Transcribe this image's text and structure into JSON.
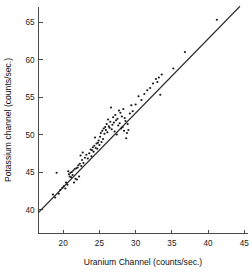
{
  "chart_data": {
    "type": "scatter",
    "title": "",
    "xlabel": "Uranium Channel (counts/sec.)",
    "ylabel": "Potassium channel (counts/sec.)",
    "xlim": [
      16.6,
      45.5
    ],
    "ylim": [
      36.8,
      67.0
    ],
    "xticks": [
      20,
      25,
      30,
      35,
      40,
      45
    ],
    "yticks": [
      40,
      45,
      50,
      55,
      60,
      65
    ],
    "xtick_labels": [
      "20",
      "25",
      "30",
      "35",
      "40",
      "45"
    ],
    "ytick_labels": [
      "40",
      "45",
      "50",
      "55",
      "60",
      "65"
    ],
    "grid": false,
    "legend": false,
    "point_color": "#1a1a1a",
    "line_color": "#2b2b2b",
    "axis_color": "#4a4a4a",
    "fit_line": {
      "label": "regression line",
      "x": [
        16.6,
        44.4
      ],
      "y": [
        39.6,
        67.1
      ]
    },
    "series": [
      {
        "name": "Uranium vs Potassium channel counts",
        "points": [
          [
            18.6,
            42.0
          ],
          [
            18.9,
            41.6
          ],
          [
            19.1,
            44.9
          ],
          [
            19.4,
            42.1
          ],
          [
            19.6,
            42.6
          ],
          [
            19.9,
            42.9
          ],
          [
            20.1,
            43.1
          ],
          [
            20.3,
            42.8
          ],
          [
            20.4,
            43.6
          ],
          [
            20.6,
            43.3
          ],
          [
            20.7,
            45.1
          ],
          [
            20.8,
            44.7
          ],
          [
            20.9,
            44.4
          ],
          [
            21.0,
            44.9
          ],
          [
            21.1,
            44.3
          ],
          [
            21.2,
            45.0
          ],
          [
            21.3,
            44.6
          ],
          [
            21.4,
            45.2
          ],
          [
            21.5,
            43.6
          ],
          [
            21.6,
            45.4
          ],
          [
            21.7,
            44.1
          ],
          [
            21.8,
            45.5
          ],
          [
            21.9,
            44.0
          ],
          [
            22.0,
            45.6
          ],
          [
            22.1,
            45.9
          ],
          [
            22.2,
            44.4
          ],
          [
            22.3,
            46.1
          ],
          [
            22.4,
            47.2
          ],
          [
            22.5,
            45.8
          ],
          [
            22.6,
            46.6
          ],
          [
            22.7,
            47.6
          ],
          [
            22.8,
            46.2
          ],
          [
            23.0,
            46.9
          ],
          [
            23.2,
            47.3
          ],
          [
            23.4,
            46.8
          ],
          [
            23.6,
            47.5
          ],
          [
            23.8,
            48.0
          ],
          [
            23.9,
            47.1
          ],
          [
            24.0,
            47.9
          ],
          [
            24.1,
            48.3
          ],
          [
            24.2,
            47.7
          ],
          [
            24.3,
            48.5
          ],
          [
            24.4,
            49.6
          ],
          [
            24.5,
            48.2
          ],
          [
            24.6,
            48.8
          ],
          [
            24.7,
            48.1
          ],
          [
            24.8,
            48.9
          ],
          [
            24.9,
            49.2
          ],
          [
            25.0,
            48.6
          ],
          [
            25.1,
            49.7
          ],
          [
            25.2,
            50.2
          ],
          [
            25.3,
            49.0
          ],
          [
            25.4,
            50.5
          ],
          [
            25.5,
            49.4
          ],
          [
            25.6,
            50.8
          ],
          [
            25.7,
            50.1
          ],
          [
            25.8,
            51.0
          ],
          [
            25.9,
            50.6
          ],
          [
            26.0,
            51.4
          ],
          [
            26.1,
            50.3
          ],
          [
            26.2,
            52.0
          ],
          [
            26.3,
            51.1
          ],
          [
            26.4,
            50.9
          ],
          [
            26.5,
            51.7
          ],
          [
            26.6,
            53.6
          ],
          [
            26.7,
            50.7
          ],
          [
            26.8,
            51.3
          ],
          [
            26.9,
            52.3
          ],
          [
            27.0,
            51.6
          ],
          [
            27.1,
            50.4
          ],
          [
            27.2,
            52.6
          ],
          [
            27.3,
            51.9
          ],
          [
            27.4,
            50.0
          ],
          [
            27.5,
            52.1
          ],
          [
            27.6,
            51.2
          ],
          [
            27.7,
            53.2
          ],
          [
            27.8,
            51.5
          ],
          [
            27.9,
            52.9
          ],
          [
            28.0,
            50.8
          ],
          [
            28.1,
            52.4
          ],
          [
            28.2,
            51.0
          ],
          [
            28.3,
            53.4
          ],
          [
            28.4,
            50.5
          ],
          [
            28.5,
            52.2
          ],
          [
            28.6,
            51.8
          ],
          [
            28.7,
            49.5
          ],
          [
            28.8,
            50.2
          ],
          [
            28.9,
            51.4
          ],
          [
            29.0,
            50.6
          ],
          [
            29.2,
            52.8
          ],
          [
            29.4,
            53.9
          ],
          [
            29.6,
            53.1
          ],
          [
            30.0,
            54.0
          ],
          [
            30.4,
            55.1
          ],
          [
            30.8,
            54.6
          ],
          [
            31.2,
            55.4
          ],
          [
            31.6,
            55.9
          ],
          [
            32.0,
            56.2
          ],
          [
            32.4,
            56.8
          ],
          [
            32.8,
            57.4
          ],
          [
            33.0,
            57.0
          ],
          [
            33.2,
            57.6
          ],
          [
            33.4,
            55.3
          ],
          [
            33.6,
            58.0
          ],
          [
            35.2,
            58.8
          ],
          [
            36.8,
            61.0
          ],
          [
            41.2,
            65.3
          ]
        ]
      }
    ]
  }
}
